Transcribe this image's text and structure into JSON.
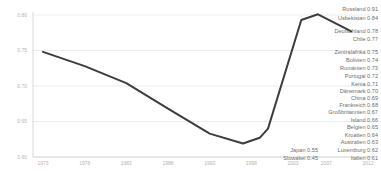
{
  "chart_data": {
    "type": "line",
    "title": "",
    "xlabel": "",
    "ylabel": "",
    "xlim": [
      1973,
      2012
    ],
    "ylim": [
      0.6,
      0.8
    ],
    "grid": true,
    "legend_position": "right",
    "x_ticks": [
      1973,
      1978,
      1983,
      1988,
      1993,
      1998,
      2003,
      2007,
      2012
    ],
    "y_ticks": [
      "0.80",
      "0.75",
      "0.70",
      "0.65",
      "0.60"
    ],
    "y_tick_values": [
      0.8,
      0.75,
      0.7,
      0.65,
      0.6
    ],
    "series": [
      {
        "name": "Deutschland",
        "color": "#3d3d3d",
        "points": [
          [
            1973,
            0.748
          ],
          [
            1978,
            0.728
          ],
          [
            1983,
            0.704
          ],
          [
            1988,
            0.668
          ],
          [
            1993,
            0.633
          ],
          [
            1997,
            0.619
          ],
          [
            1999,
            0.627
          ],
          [
            2000,
            0.64
          ],
          [
            2004,
            0.793
          ],
          [
            2006,
            0.801
          ],
          [
            2010,
            0.777
          ]
        ]
      }
    ],
    "end_labels": [
      {
        "name": "Russland",
        "value": "0.91"
      },
      {
        "name": "Usbekistan",
        "value": "0.84"
      },
      {
        "name": "Deutschland",
        "value": "0.78"
      },
      {
        "name": "Chile",
        "value": "0.77"
      },
      {
        "name": "Zentralafrika",
        "value": "0.75"
      },
      {
        "name": "Bolivien",
        "value": "0.74"
      },
      {
        "name": "Rumänien",
        "value": "0.73"
      },
      {
        "name": "Portugal",
        "value": "0.72"
      },
      {
        "name": "Kenia",
        "value": "0.71"
      },
      {
        "name": "Dänemark",
        "value": "0.70"
      },
      {
        "name": "China",
        "value": "0.69"
      },
      {
        "name": "Frankreich",
        "value": "0.68"
      },
      {
        "name": "Großbritannien",
        "value": "0.67"
      },
      {
        "name": "Island",
        "value": "0.66"
      },
      {
        "name": "Belgien",
        "value": "0.65"
      },
      {
        "name": "Kroatien",
        "value": "0.64"
      },
      {
        "name": "Australien",
        "value": "0.63"
      },
      {
        "name": "Luxemburg",
        "value": "0.62"
      },
      {
        "name": "Italien",
        "value": "0.61"
      }
    ],
    "side_labels": [
      {
        "name": "Japan",
        "value": "0.55",
        "align_with": "Luxemburg"
      },
      {
        "name": "Slowakei",
        "value": "0.45",
        "align_with": "Italien"
      }
    ]
  },
  "colors": {
    "line": "#3d3d3d",
    "gridline": "#ececec",
    "axis": "#d9d9d9",
    "tick_text": "#b3b3b3",
    "legend_text": "#6e6e6e",
    "background": "#ffffff"
  }
}
